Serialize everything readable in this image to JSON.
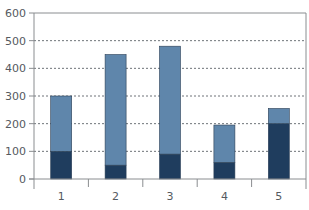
{
  "chart_data": {
    "type": "bar",
    "stacked": true,
    "title": "",
    "xlabel": "",
    "ylabel": "",
    "categories": [
      "1",
      "2",
      "3",
      "4",
      "5"
    ],
    "series": [
      {
        "name": "Series 1 (bottom, dark)",
        "color": "#1f3d5e",
        "values": [
          100,
          50,
          90,
          60,
          200
        ]
      },
      {
        "name": "Series 2 (top, light)",
        "color": "#5f86ab",
        "values": [
          200,
          400,
          390,
          135,
          55
        ]
      }
    ],
    "totals": [
      300,
      450,
      480,
      195,
      255
    ],
    "ylim": [
      0,
      600
    ],
    "yticks": [
      0,
      100,
      200,
      300,
      400,
      500,
      600
    ],
    "grid": {
      "horizontal": true,
      "style": "dashed"
    },
    "legend": null
  },
  "layout": {
    "plot_left": 34,
    "plot_right": 306,
    "plot_top": 13,
    "plot_bottom": 179,
    "bar_width": 21,
    "axis_color": "#8a8d90",
    "grid_color": "#6e7378"
  }
}
